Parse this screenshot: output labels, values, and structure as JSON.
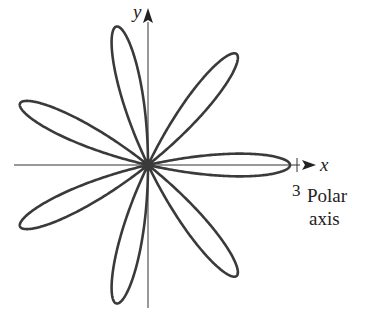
{
  "chart_data": {
    "type": "line",
    "title": "",
    "equation": "r = 3 cos(7θ)",
    "petals": 7,
    "amplitude": 3,
    "petal_angles_deg": [
      0,
      51.43,
      102.86,
      154.29,
      205.71,
      257.14,
      308.57
    ],
    "xlabel": "x",
    "ylabel": "y",
    "tick_labels": [
      {
        "value": 3,
        "axis": "x",
        "label": "3"
      }
    ],
    "annotations": [
      "Polar axis"
    ],
    "grid": false
  },
  "labels": {
    "x_axis": "x",
    "y_axis": "y",
    "tick_3": "3",
    "polar_line1": "Polar",
    "polar_line2": "axis"
  },
  "colors": {
    "curve": "#3a3a3a",
    "axis": "#333333"
  }
}
